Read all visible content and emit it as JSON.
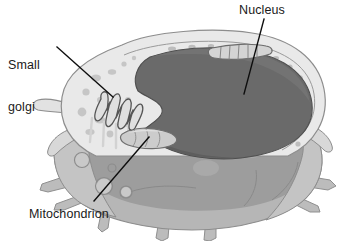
{
  "figure": {
    "width": 348,
    "height": 241,
    "background": "#ffffff"
  },
  "labels": {
    "golgi": {
      "line1": "Small",
      "line2": "golgi",
      "full": "Small golgi"
    },
    "nucleus": {
      "text": "Nucleus"
    },
    "mitochondrion": {
      "text": "Mitochondrion"
    }
  },
  "leader_lines": [
    {
      "name": "golgi-leader",
      "x1": 57,
      "y1": 47,
      "x2": 113,
      "y2": 97
    },
    {
      "name": "nucleus-leader",
      "x1": 264,
      "y1": 19,
      "x2": 244,
      "y2": 94
    },
    {
      "name": "mitochondrion-leader",
      "x1": 94,
      "y1": 201,
      "x2": 149,
      "y2": 137
    }
  ],
  "colors": {
    "text": "#1a1a1a",
    "leader_line": "#0d0d0d",
    "nucleus_fill": "#6a6a6a",
    "nucleus_stroke": "#4f4f4f",
    "cytoplasm_upper": "#e9e9e9",
    "cytoplasm_lower": "#b6b6b6",
    "cytoplasm_lower_dark": "#9d9d9d",
    "membrane_stroke": "#8d8d8d",
    "organelle_fill": "#c9c9c9",
    "organelle_stroke": "#7d7d7d",
    "vesicle_fill": "#bdbdbd",
    "golgi_stroke": "#555555",
    "golgi_fill": "#e0e0e0",
    "mitochondrion_fill": "#cccccc",
    "mitochondrion_stroke": "#6f6f6f",
    "rough_er_fill": "#d4d4d4",
    "rough_er_stroke": "#6b6b6b"
  },
  "structures": [
    {
      "name": "nucleus",
      "label": "Nucleus",
      "description": "Large kidney-shaped dark gray organelle occupying the center and right of the cell, with a notch on the left side"
    },
    {
      "name": "small-golgi",
      "label": "Small golgi",
      "description": "Folded ribbon-like stack of membranes at the left of the cell, beside the nuclear notch"
    },
    {
      "name": "mitochondrion",
      "label": "Mitochondrion",
      "description": "Elongated oval organelle at the lower left of the nucleus"
    },
    {
      "name": "rough-er",
      "label": "",
      "description": "Segmented elongated compartment at the upper right rim of the cell"
    },
    {
      "name": "cell-membrane",
      "label": "",
      "description": "Outer boundary with spiky pseudopod and filopodia projections"
    },
    {
      "name": "cytoplasm",
      "label": "",
      "description": "Light gray upper region and medium gray translucent lower region"
    }
  ]
}
